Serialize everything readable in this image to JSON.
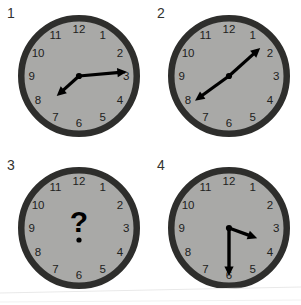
{
  "image": {
    "title": "Four analog clocks puzzle",
    "background_color": "#ffffff",
    "grid": {
      "columns": 2,
      "rows": 2
    }
  },
  "style": {
    "face_color": "#a9a9a7",
    "rim_color": "#2e2e2c",
    "numeral_color": "#212120",
    "hand_color": "#000000",
    "label_color": "#33332f",
    "question_color": "#000000"
  },
  "clock_numerals": [
    "12",
    "1",
    "2",
    "3",
    "4",
    "5",
    "6",
    "7",
    "8",
    "9",
    "10",
    "11"
  ],
  "panels": [
    {
      "label": "1",
      "name": "clock-one",
      "center": {
        "x": 79,
        "y": 76
      },
      "radius": 61,
      "has_question_mark": false,
      "question_mark": "",
      "hands": {
        "minute": {
          "target_hour_mark": 3,
          "angle_deg": 85,
          "length": 48,
          "width": 3.2,
          "arrow": true
        },
        "hour": {
          "target_hour_mark": 7.6,
          "angle_deg": 228,
          "length": 30,
          "width": 3.2,
          "arrow": true
        }
      },
      "reads_time": "7:15"
    },
    {
      "label": "2",
      "name": "clock-two",
      "center": {
        "x": 229,
        "y": 76
      },
      "radius": 61,
      "has_question_mark": false,
      "question_mark": "",
      "hands": {
        "minute": {
          "target_hour_mark": 1.6,
          "angle_deg": 48,
          "length": 42,
          "width": 3.2,
          "arrow": true
        },
        "hour": {
          "target_hour_mark": 7.9,
          "angle_deg": 234,
          "length": 42,
          "width": 3.2,
          "arrow": true
        }
      },
      "reads_time": "7:08"
    },
    {
      "label": "3",
      "name": "clock-three",
      "center": {
        "x": 79,
        "y": 228
      },
      "radius": 61,
      "has_question_mark": true,
      "question_mark": "?",
      "hands": null,
      "reads_time": ""
    },
    {
      "label": "4",
      "name": "clock-four",
      "center": {
        "x": 229,
        "y": 228
      },
      "radius": 61,
      "has_question_mark": false,
      "question_mark": "",
      "hands": {
        "minute": {
          "target_hour_mark": 6,
          "angle_deg": 180,
          "length": 48,
          "width": 3.4,
          "arrow": true
        },
        "hour": {
          "target_hour_mark": 3.6,
          "angle_deg": 110,
          "length": 30,
          "width": 3.4,
          "arrow": true
        }
      },
      "reads_time": "3:30"
    }
  ]
}
